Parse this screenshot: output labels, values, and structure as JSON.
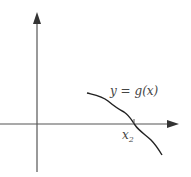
{
  "diagram": {
    "type": "function-graph",
    "curve_label": "y = g(x)",
    "root_label": "x",
    "root_subscript": "2",
    "colors": {
      "axis": "#555555",
      "curve": "#222222",
      "text": "#444444",
      "background": "#ffffff"
    }
  }
}
